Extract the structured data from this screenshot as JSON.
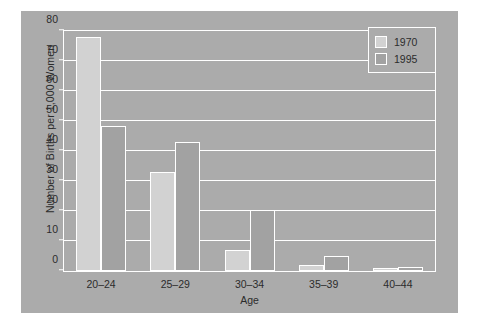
{
  "chart_data": {
    "type": "bar",
    "title": "",
    "xlabel": "Age",
    "ylabel": "Number of Births per 1,000 Women",
    "categories": [
      "20–24",
      "25–29",
      "30–34",
      "35–39",
      "40–44"
    ],
    "series": [
      {
        "name": "1970",
        "values": [
          78,
          33,
          7,
          2,
          0.5
        ],
        "color": "#d2d2d2"
      },
      {
        "name": "1995",
        "values": [
          48.5,
          43,
          20.5,
          5,
          1.5
        ],
        "color": "#a2a2a2"
      }
    ],
    "ylim": [
      0,
      80
    ],
    "yticks": [
      0,
      10,
      20,
      30,
      40,
      50,
      60,
      70,
      80
    ],
    "ytick_labels": [
      "0",
      "10",
      "20",
      "30",
      "40",
      "50",
      "60",
      "70",
      "80"
    ],
    "grid": true,
    "grid_color": "#ffffff",
    "legend_position": "top-right",
    "plot_background": "#ababab",
    "figure_background": "#ababab",
    "page_background": "#ffffff",
    "text_color": "#2b2b2b"
  }
}
